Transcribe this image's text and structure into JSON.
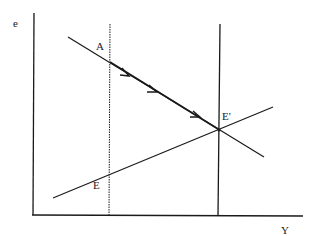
{
  "diagram": {
    "type": "economics-curve-diagram",
    "axes": {
      "y_label": "e",
      "x_label": "Y"
    },
    "points": {
      "A": "A",
      "E": "E",
      "E_prime": "E'"
    },
    "lines": [
      {
        "id": "downward-sloping-line",
        "description": "negatively sloped line through A and E' with arrows indicating movement from A toward E'"
      },
      {
        "id": "upward-sloping-line",
        "description": "positively sloped line through E and E'"
      },
      {
        "id": "dotted-vertical-line",
        "description": "dotted vertical line through A and E"
      },
      {
        "id": "solid-vertical-line",
        "description": "solid vertical line through E'"
      }
    ],
    "arrow_count": 3,
    "colors": {
      "line": "#1a1a1a",
      "background": "#ffffff"
    }
  }
}
